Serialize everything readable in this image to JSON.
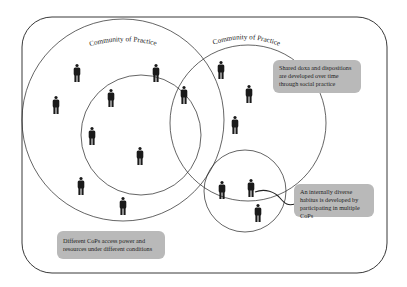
{
  "diagram": {
    "communities": [
      {
        "label": "Community of Practice"
      },
      {
        "label": "Community of Practice"
      }
    ],
    "callouts": {
      "shared_doxa": "Shared doxa and dispositions are developed over time through social practice",
      "internal_habitus": "An internally diverse habitus is developed by participating in multiple CoPs",
      "power_resources": "Different CoPs access power and resources under different conditions"
    },
    "colors": {
      "stroke": "#222222",
      "person": "#1a1a1a",
      "callout_bg": "#b9b9b9"
    },
    "person_count": 16
  }
}
